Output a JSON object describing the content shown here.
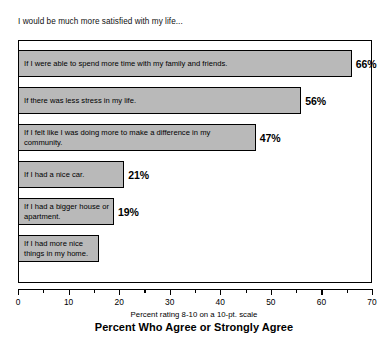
{
  "header": {
    "question": "I would be much more satisfied with my life..."
  },
  "captions": {
    "axis_caption": "Percent rating 8-10 on a 10-pt. scale",
    "chart_title": "Percent Who Agree or Strongly Agree"
  },
  "axis": {
    "tick_labels": [
      "0",
      "10",
      "20",
      "30",
      "40",
      "50",
      "60",
      "70"
    ]
  },
  "chart_data": {
    "type": "bar",
    "orientation": "horizontal",
    "title": "Percent Who Agree or Strongly Agree",
    "subtitle": "I would be much more satisfied with my life...",
    "xlabel": "Percent rating 8-10 on a 10-pt. scale",
    "ylabel": "",
    "xlim": [
      0,
      70
    ],
    "xticks": [
      0,
      10,
      20,
      30,
      40,
      50,
      60,
      70
    ],
    "minor_xticks": [
      5,
      15,
      25,
      35,
      45,
      55,
      65
    ],
    "grid": false,
    "legend": "none",
    "bar_color": "#b9b9b9",
    "bar_edge_color": "#000000",
    "categories": [
      "If I were able to spend more time with my family and friends.",
      "If there was less stress in my life.",
      "If I felt like I was doing more to make a difference in my community.",
      "If I had a nice car.",
      "If I had a bigger house or apartment.",
      "If I had more nice things in my home."
    ],
    "values": [
      66,
      56,
      47,
      21,
      19,
      16
    ],
    "data_labels": [
      "66%",
      "56%",
      "47%",
      "21%",
      "19%",
      ""
    ]
  }
}
